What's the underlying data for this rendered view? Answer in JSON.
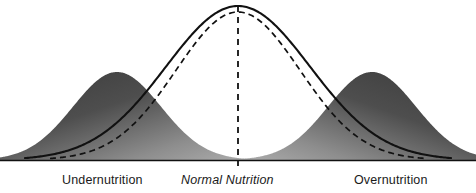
{
  "figure": {
    "width": 476,
    "height": 193,
    "background": "#ffffff"
  },
  "labels": {
    "left": "Undernutrition",
    "center": "Normal Nutrition",
    "right": "Overnutrition"
  },
  "colors": {
    "line": "#111111",
    "baseline": "#111111",
    "fill_dark": "#3f3f3f",
    "fill_light": "#a3a3a3",
    "text": "#1a1a1a"
  },
  "chart_data": {
    "type": "line",
    "xlabel": "",
    "ylabel": "",
    "grid": false,
    "legend": "none",
    "axis": {
      "baseline_y": 160,
      "x_range": [
        0,
        476
      ],
      "y_range": [
        160,
        0
      ]
    },
    "annotations": [
      {
        "text": "Undernutrition",
        "x": 125,
        "y": 182,
        "style": "normal"
      },
      {
        "text": "Normal Nutrition",
        "x": 238,
        "y": 182,
        "style": "italic"
      },
      {
        "text": "Overnutrition",
        "x": 400,
        "y": 182,
        "style": "normal"
      }
    ],
    "reference_lines": [
      {
        "name": "center-mean-line",
        "orientation": "vertical",
        "x": 238,
        "style": "dashed",
        "from_y": 6,
        "to_y": 168
      }
    ],
    "series": [
      {
        "name": "Normal Nutrition (observed)",
        "style": "solid",
        "fill": "none",
        "distribution": "normal",
        "mean": 238,
        "sigma": 72,
        "peak_height": 154,
        "x_start": 25,
        "x_end": 451
      },
      {
        "name": "Normal Nutrition (expected)",
        "style": "dashed",
        "fill": "none",
        "distribution": "normal",
        "mean": 238,
        "sigma": 62,
        "peak_height": 148,
        "x_start": 50,
        "x_end": 426
      },
      {
        "name": "Undernutrition",
        "style": "filled",
        "fill": "gradient-dark-to-light",
        "distribution": "normal",
        "mean": 117,
        "sigma": 44,
        "peak_height": 88,
        "x_start": 0,
        "x_end": 260
      },
      {
        "name": "Overnutrition",
        "style": "filled",
        "fill": "gradient-dark-to-light",
        "distribution": "normal",
        "mean": 372,
        "sigma": 44,
        "peak_height": 88,
        "x_start": 228,
        "x_end": 476
      }
    ]
  }
}
